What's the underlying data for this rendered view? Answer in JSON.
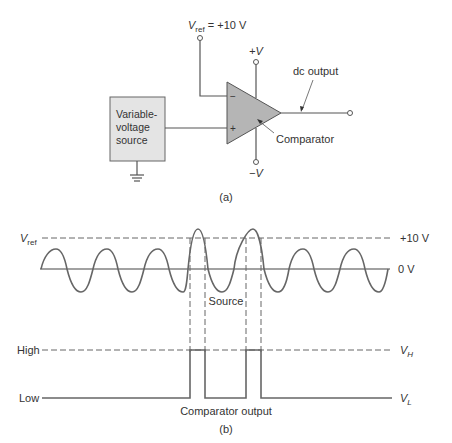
{
  "circuit": {
    "vref_label": "V",
    "vref_sub": "ref",
    "vref_value": " = +10 V",
    "plus_v_label": "+V",
    "minus_v_label": "−V",
    "dc_output_label": "dc output",
    "source_box": [
      "Variable-",
      "voltage",
      "source"
    ],
    "comparator_label": "Comparator",
    "minus_input": "−",
    "plus_input": "+",
    "caption": "(a)"
  },
  "waveform": {
    "vref_label": "V",
    "vref_sub": "ref",
    "plus10_label": "+10 V",
    "zero_label": "0 V",
    "source_label": "Source",
    "high_label": "High",
    "low_label": "Low",
    "vh_label": "V",
    "vh_sub": "H",
    "vl_label": "V",
    "vl_sub": "L",
    "output_label": "Comparator output",
    "caption": "(b)"
  },
  "colors": {
    "line": "#555555",
    "box_fill": "#e4e4e4",
    "triangle_fill": "#b5b5b5"
  }
}
